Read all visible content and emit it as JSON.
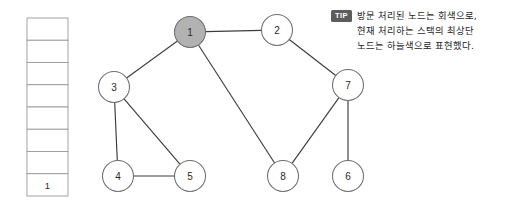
{
  "figure": {
    "background_color": "#ffffff"
  },
  "stack": {
    "name": "dfs-stack",
    "capacity": 8,
    "cells": [
      {
        "index": 7,
        "value": ""
      },
      {
        "index": 6,
        "value": ""
      },
      {
        "index": 5,
        "value": ""
      },
      {
        "index": 4,
        "value": ""
      },
      {
        "index": 3,
        "value": ""
      },
      {
        "index": 2,
        "value": ""
      },
      {
        "index": 1,
        "value": ""
      },
      {
        "index": 0,
        "value": "1"
      }
    ],
    "border_color": "#9a9a9a",
    "fill_color": "#ffffff"
  },
  "graph": {
    "visited_fill_color": "#b2b2b2",
    "unvisited_fill_color": "#ffffff",
    "node_stroke_color": "#6e6e6e",
    "edge_color": "#3c3c3c",
    "nodes": [
      {
        "id": "1",
        "label": "1",
        "cx": 190,
        "cy": 32,
        "r": 15.5,
        "state": "visited"
      },
      {
        "id": "2",
        "label": "2",
        "cx": 277,
        "cy": 30,
        "r": 15.5,
        "state": "unvisited"
      },
      {
        "id": "3",
        "label": "3",
        "cx": 114,
        "cy": 87,
        "r": 15.5,
        "state": "unvisited"
      },
      {
        "id": "7",
        "label": "7",
        "cx": 348,
        "cy": 85,
        "r": 15.5,
        "state": "unvisited"
      },
      {
        "id": "4",
        "label": "4",
        "cx": 118,
        "cy": 176,
        "r": 15.5,
        "state": "unvisited"
      },
      {
        "id": "5",
        "label": "5",
        "cx": 190,
        "cy": 176,
        "r": 15.5,
        "state": "unvisited"
      },
      {
        "id": "8",
        "label": "8",
        "cx": 283,
        "cy": 176,
        "r": 15.5,
        "state": "unvisited"
      },
      {
        "id": "6",
        "label": "6",
        "cx": 348,
        "cy": 176,
        "r": 15.5,
        "state": "unvisited"
      }
    ],
    "edges": [
      {
        "from": "1",
        "to": "2"
      },
      {
        "from": "1",
        "to": "3"
      },
      {
        "from": "1",
        "to": "8"
      },
      {
        "from": "2",
        "to": "7"
      },
      {
        "from": "3",
        "to": "4"
      },
      {
        "from": "3",
        "to": "5"
      },
      {
        "from": "4",
        "to": "5"
      },
      {
        "from": "7",
        "to": "8"
      },
      {
        "from": "7",
        "to": "6"
      }
    ]
  },
  "tip": {
    "badge": "TIP",
    "badge_bg_color": "#5c5c5c",
    "badge_text_color": "#ffffff",
    "lines": [
      "방문 처리된 노드는 회색으로,",
      "현재 처리하는 스택의 최상단",
      "노드는 하늘색으로 표현했다."
    ]
  }
}
